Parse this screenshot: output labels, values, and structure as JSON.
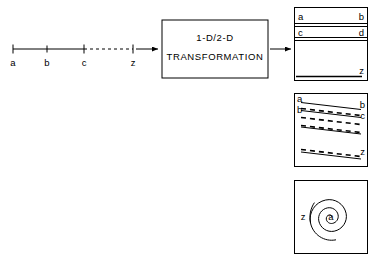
{
  "figure": {
    "title_block": {
      "line1": "1-D/2-D",
      "line2": "TRANSFORMATION"
    },
    "input_axis": {
      "name": "one-dimensional-sequence-axis",
      "tick_labels": [
        "a",
        "b",
        "c",
        "z"
      ],
      "gap_marker": "dashed-ellipsis",
      "description": "1-D line with labeled positions a, b, c ... z"
    },
    "arrows": {
      "input_arrow": "arrow-right",
      "output_arrow": "arrow-right"
    },
    "panels": [
      {
        "id": "raster-panel",
        "name": "raster-scan-mapping",
        "labels": {
          "row1_left": "a",
          "row1_right": "b",
          "row2_left": "c",
          "row2_right": "d",
          "last_right": "z"
        }
      },
      {
        "id": "diagonal-panel",
        "name": "diagonal-scan-mapping",
        "labels": {
          "row1_left": "a",
          "row1_right": "b",
          "row2_left": "b",
          "row2_right": "c",
          "last_right": "z"
        }
      },
      {
        "id": "spiral-panel",
        "name": "spiral-scan-mapping",
        "labels": {
          "center": "a",
          "outer": "z"
        }
      }
    ],
    "colors": {
      "ink": "#000000",
      "background": "#ffffff"
    }
  }
}
